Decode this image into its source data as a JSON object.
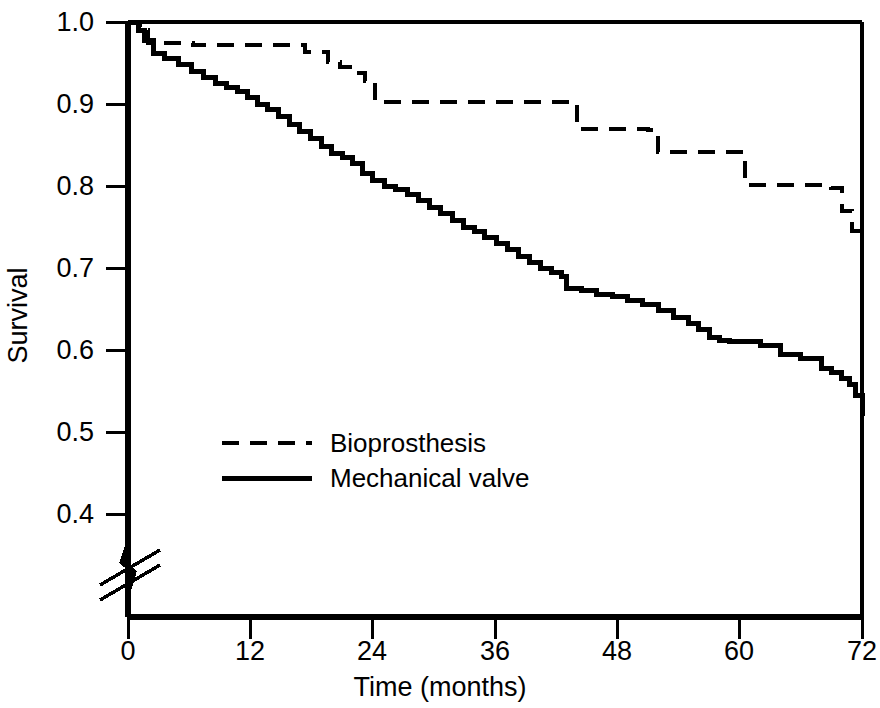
{
  "chart_data": {
    "type": "line",
    "subtype": "kaplan-meier-step",
    "title": "",
    "xlabel": "Time (months)",
    "ylabel": "Survival",
    "xlim": [
      0,
      72
    ],
    "ylim": [
      0.355,
      1.0
    ],
    "y_axis_break": true,
    "y_axis_break_note": "axis broken below 0.4",
    "grid": false,
    "legend_position": "inside-left-lower",
    "xticks": [
      0,
      12,
      24,
      36,
      48,
      60,
      72
    ],
    "xtick_labels": [
      "0",
      "12",
      "24",
      "36",
      "48",
      "60",
      "72"
    ],
    "yticks": [
      1.0,
      0.9,
      0.8,
      0.7,
      0.6,
      0.5,
      0.4
    ],
    "ytick_labels": [
      "1.0",
      "0.9",
      "0.8",
      "0.7",
      "0.6",
      "0.5",
      "0.4"
    ],
    "series": [
      {
        "name": "Bioprosthesis",
        "style": "dashed",
        "color": "#000000",
        "x": [
          0,
          0.6,
          1.2,
          2.0,
          5.5,
          6.4,
          16.4,
          17.4,
          18.6,
          19.6,
          20.8,
          22.0,
          23.2,
          24.2,
          24.2,
          40.0,
          44.0,
          44.0,
          45.0,
          51.0,
          52.0,
          59.5,
          60.5,
          68.0,
          69.0,
          70.0,
          71.0,
          72.0
        ],
        "y": [
          1.0,
          1.0,
          0.99,
          0.975,
          0.975,
          0.972,
          0.972,
          0.963,
          0.963,
          0.951,
          0.945,
          0.938,
          0.928,
          0.918,
          0.902,
          0.902,
          0.899,
          0.87,
          0.87,
          0.868,
          0.842,
          0.842,
          0.801,
          0.801,
          0.797,
          0.77,
          0.745,
          0.715
        ]
      },
      {
        "name": "Mechanical valve",
        "style": "solid",
        "color": "#000000",
        "x": [
          0,
          0.5,
          1.0,
          1.6,
          2.5,
          3.6,
          5.0,
          6.2,
          7.4,
          8.6,
          9.7,
          10.7,
          11.7,
          12.7,
          13.7,
          14.8,
          15.8,
          16.8,
          17.9,
          19.0,
          20.0,
          21.0,
          22.0,
          23.0,
          24.0,
          25.2,
          26.2,
          27.4,
          28.5,
          29.6,
          30.7,
          31.8,
          32.9,
          34.0,
          35.0,
          36.1,
          37.2,
          38.3,
          39.4,
          40.5,
          41.5,
          42.5,
          43.0,
          44.5,
          46.0,
          47.5,
          49.0,
          50.5,
          52.0,
          53.5,
          55.0,
          56.0,
          57.0,
          58.0,
          59.0,
          60.0,
          62.0,
          64.0,
          66.0,
          68.0,
          69.0,
          70.0,
          70.8,
          71.4,
          72.0
        ],
        "y": [
          1.0,
          1.0,
          0.99,
          0.977,
          0.962,
          0.955,
          0.948,
          0.94,
          0.932,
          0.925,
          0.92,
          0.915,
          0.908,
          0.9,
          0.893,
          0.885,
          0.875,
          0.866,
          0.858,
          0.848,
          0.84,
          0.835,
          0.828,
          0.815,
          0.807,
          0.8,
          0.796,
          0.79,
          0.782,
          0.774,
          0.766,
          0.758,
          0.75,
          0.744,
          0.737,
          0.73,
          0.722,
          0.714,
          0.707,
          0.7,
          0.695,
          0.69,
          0.675,
          0.672,
          0.668,
          0.665,
          0.66,
          0.655,
          0.648,
          0.64,
          0.632,
          0.625,
          0.615,
          0.612,
          0.61,
          0.61,
          0.605,
          0.595,
          0.59,
          0.578,
          0.572,
          0.565,
          0.558,
          0.545,
          0.52
        ]
      }
    ]
  },
  "legend": {
    "entries": [
      {
        "label": "Bioprosthesis",
        "style": "dashed"
      },
      {
        "label": "Mechanical valve",
        "style": "solid"
      }
    ]
  },
  "colors": {
    "axis": "#000000",
    "line": "#000000",
    "background": "#ffffff"
  }
}
